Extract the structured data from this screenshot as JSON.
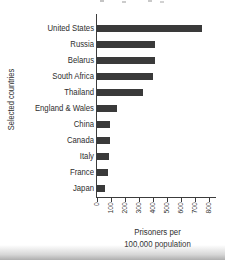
{
  "chart_data": {
    "type": "bar",
    "orientation": "horizontal",
    "categories": [
      "United States",
      "Russia",
      "Belarus",
      "South Africa",
      "Thailand",
      "England & Wales",
      "China",
      "Canada",
      "Italy",
      "France",
      "Japan"
    ],
    "values": [
      750,
      415,
      415,
      400,
      330,
      145,
      95,
      95,
      85,
      80,
      60
    ],
    "xlabel": "Prisoners per 100,000 population",
    "xlabel_lines": [
      "Prisoners per",
      "100,000 population"
    ],
    "ylabel": "Selected countries",
    "xlim": [
      0,
      800
    ],
    "x_ticks": [
      0,
      100,
      200,
      300,
      400,
      500,
      600,
      700,
      800
    ],
    "grid": false,
    "legend": "none",
    "bar_color": "#3a3a3a",
    "axis_color": "#3c3c3c"
  }
}
